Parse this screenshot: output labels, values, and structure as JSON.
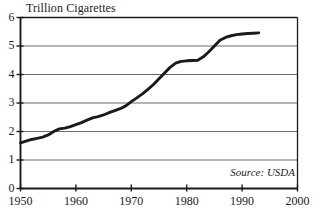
{
  "chart_data": {
    "type": "line",
    "title": "Trillion Cigarettes",
    "xlabel": "",
    "ylabel": "Trillion Cigarettes",
    "xlim": [
      1950,
      2000
    ],
    "ylim": [
      0,
      6
    ],
    "grid": true,
    "legend": null,
    "annotations": [
      {
        "name": "source",
        "text": "Source: USDA"
      }
    ],
    "xticks": [
      1950,
      1960,
      1970,
      1980,
      1990,
      2000
    ],
    "xtick_labels": [
      "1950",
      "1960",
      "1970",
      "1980",
      "1990",
      "2000"
    ],
    "yticks": [
      0,
      1,
      2,
      3,
      4,
      5,
      6
    ],
    "ytick_labels": [
      "0",
      "1",
      "2",
      "3",
      "4",
      "5",
      "6"
    ],
    "series": [
      {
        "name": "World Cigarette Production",
        "color": "#1a1a1a",
        "x": [
          1950,
          1951,
          1952,
          1953,
          1954,
          1955,
          1956,
          1957,
          1958,
          1959,
          1960,
          1961,
          1962,
          1963,
          1964,
          1965,
          1966,
          1967,
          1968,
          1969,
          1970,
          1971,
          1972,
          1973,
          1974,
          1975,
          1976,
          1977,
          1978,
          1979,
          1980,
          1981,
          1982,
          1983,
          1984,
          1985,
          1986,
          1987,
          1988,
          1989,
          1990,
          1991,
          1992,
          1993
        ],
        "values": [
          1.6,
          1.66,
          1.72,
          1.76,
          1.8,
          1.88,
          2.0,
          2.09,
          2.12,
          2.17,
          2.24,
          2.31,
          2.4,
          2.48,
          2.52,
          2.58,
          2.66,
          2.73,
          2.8,
          2.9,
          3.05,
          3.18,
          3.32,
          3.48,
          3.65,
          3.85,
          4.05,
          4.25,
          4.4,
          4.46,
          4.48,
          4.49,
          4.5,
          4.62,
          4.8,
          5.0,
          5.2,
          5.3,
          5.36,
          5.4,
          5.42,
          5.44,
          5.45,
          5.46
        ]
      }
    ]
  },
  "axes": {
    "title": "Trillion Cigarettes",
    "source_text": "Source: USDA"
  }
}
